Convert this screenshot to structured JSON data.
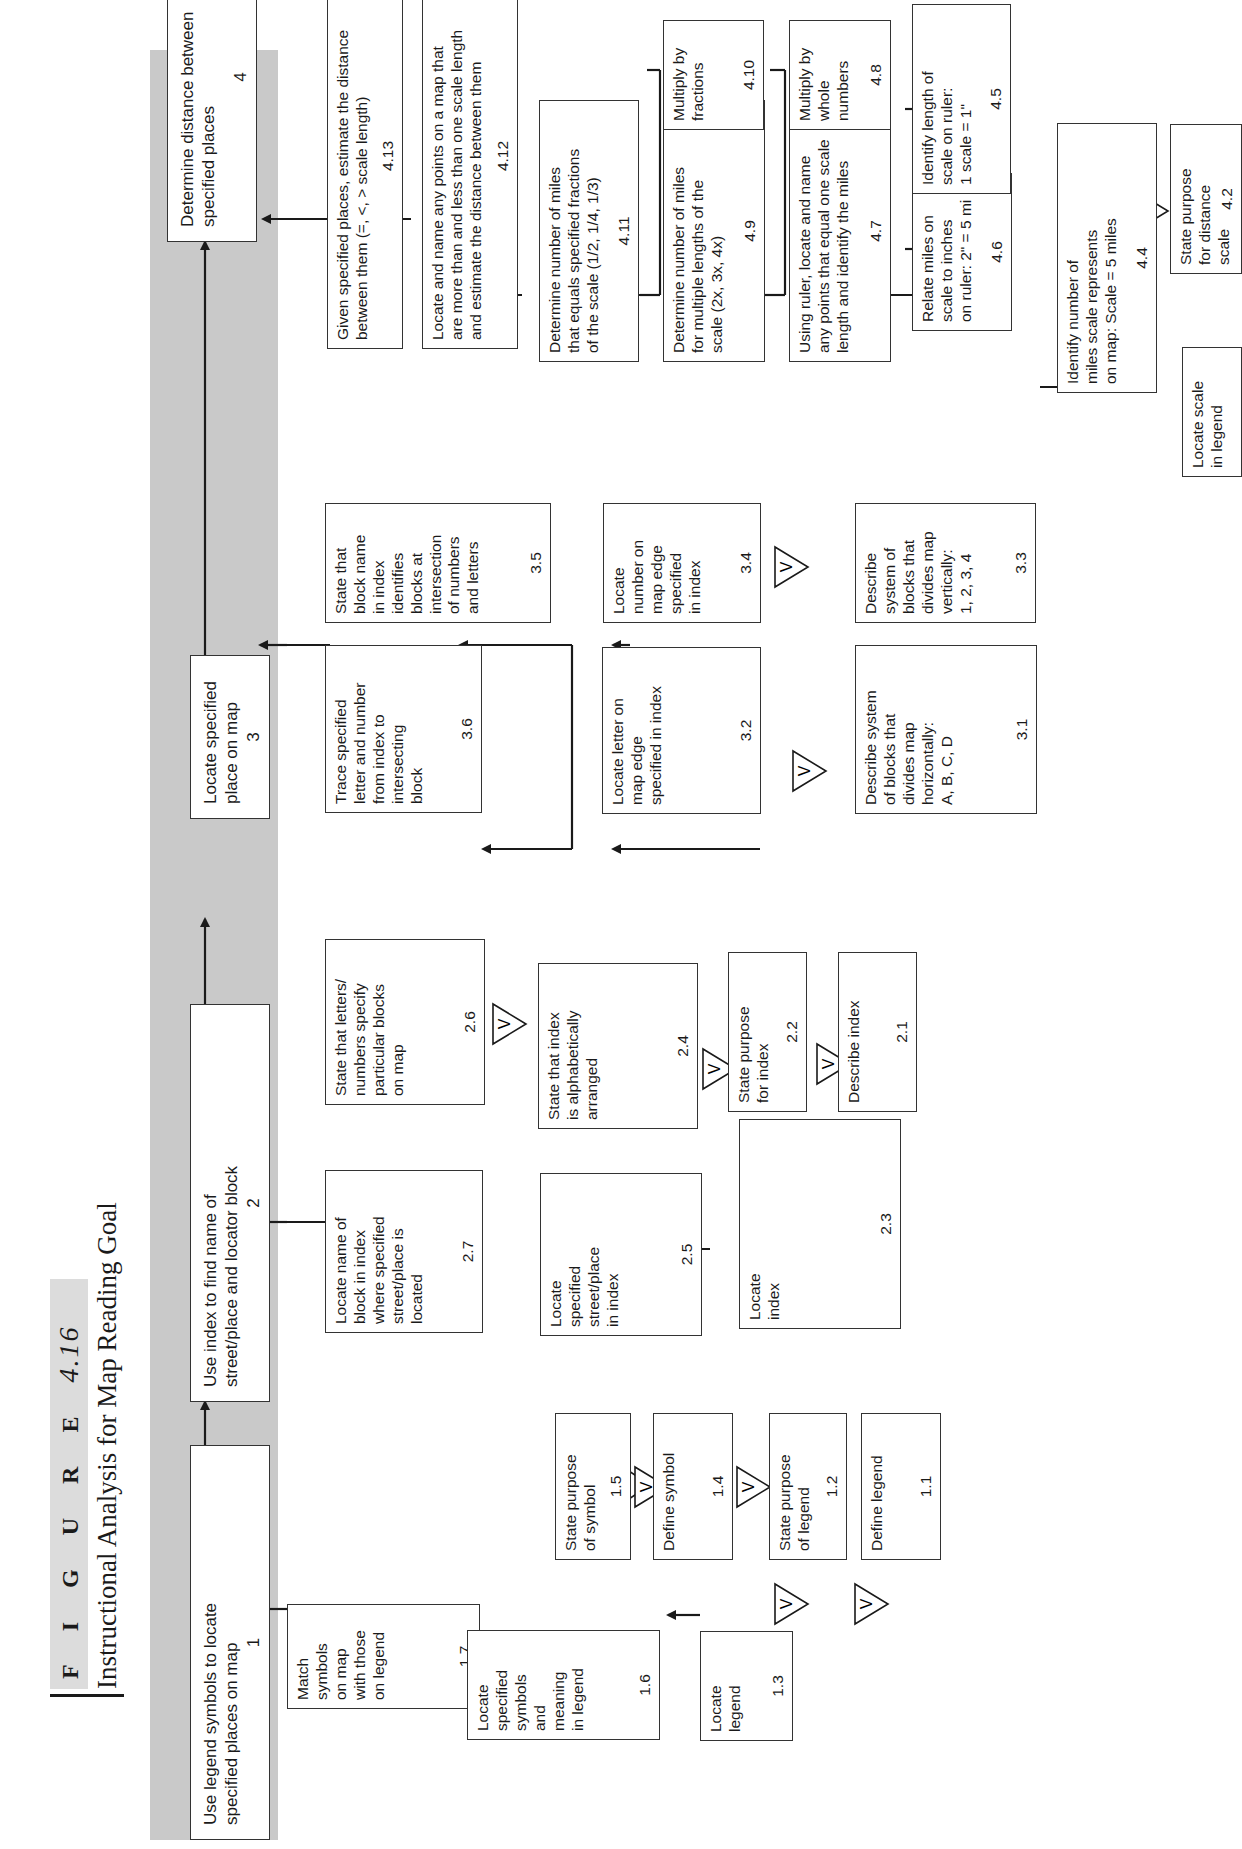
{
  "figure": {
    "label": "F I G U R E",
    "number": "4.16",
    "title": "Instructional Analysis for Map Reading Goal"
  },
  "verbal_info_symbol": "V",
  "goals": [
    {
      "id": "1",
      "text": "Use legend symbols to locate\nspecified places on map"
    },
    {
      "id": "2",
      "text": "Use index to find name of\nstreet/place and locator block"
    },
    {
      "id": "3",
      "text": "Locate specified\nplace on map"
    },
    {
      "id": "4",
      "text": "Determine distance between\nspecified places"
    }
  ],
  "steps": {
    "1.1": "Define legend",
    "1.2": "State purpose\nof legend",
    "1.3": "Locate\nlegend",
    "1.4": "Define symbol",
    "1.5": "State purpose\nof symbol",
    "1.6": "Locate\nspecified\nsymbols\nand\nmeaning\nin legend",
    "1.7": "Match\nsymbols\non map\nwith those\non legend",
    "2.1": "Describe index",
    "2.2": "State purpose\nfor index",
    "2.3": "Locate\nindex",
    "2.4": "State that index\nis alphabetically\narranged",
    "2.5": "Locate\nspecified\nstreet/place\nin index",
    "2.6": "State that letters/\nnumbers specify\nparticular blocks\non map",
    "2.7": "Locate name of\nblock in index\nwhere specified\nstreet/place is\nlocated",
    "3.1": "Describe system\nof blocks that\ndivides map\nhorizontally:\nA, B, C, D",
    "3.2": "Locate letter on\nmap edge\nspecified in index",
    "3.3": "Describe\nsystem of\nblocks that\ndivides map\nvertically:\n1, 2, 3, 4",
    "3.4": "Locate\nnumber on\nmap edge\nspecified\nin index",
    "3.5": "State that\nblock name\nin index\nidentifies\nblocks at\nintersection\nof numbers\nand letters",
    "3.6": "Trace specified\nletter and number\nfrom index to\nintersecting\nblock",
    "4.2": "State purpose\nfor distance\nscale",
    "4.3": "Locate scale\nin legend",
    "4.4": "Identify number of\nmiles scale represents\non map: Scale = 5 miles",
    "4.5": "Identify length of\nscale on ruler:\n1 scale = 1\"",
    "4.6": "Relate miles on\nscale to inches\non ruler: 2\" = 5 mi",
    "4.7": "Using ruler, locate and name\nany points that equal one scale\nlength and identify the miles",
    "4.8": "Multiply by\nwhole\nnumbers",
    "4.9": "Determine number of miles\nfor multiple lengths of the\nscale (2x, 3x, 4x)",
    "4.10": "Multiply by\nfractions",
    "4.11": "Determine number of miles\nthat equals specified fractions\nof the scale (1/2, 1/4, 1/3)",
    "4.12": "Locate and name any points on a  map that\nare more than and less than one scale length\nand estimate the distance between them",
    "4.13": "Given specified places, estimate the distance\nbetween them (=, <, > scale length)"
  }
}
